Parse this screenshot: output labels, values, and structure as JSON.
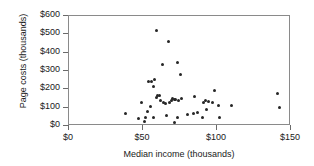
{
  "chart_data": {
    "type": "scatter",
    "title": "",
    "xlabel": "Median income (thousands)",
    "ylabel": "Page costs (thousands)",
    "xlim": [
      0,
      150
    ],
    "ylim": [
      0,
      600
    ],
    "xticks": [
      "$0",
      "$50",
      "$100",
      "$150"
    ],
    "xtick_values": [
      0,
      50,
      100,
      150
    ],
    "yticks": [
      "$0",
      "$100",
      "$200",
      "$300",
      "$400",
      "$500",
      "$600"
    ],
    "ytick_values": [
      0,
      100,
      200,
      300,
      400,
      500,
      600
    ],
    "grid": false,
    "legend": false,
    "marker_color": "#262626",
    "axis_color": "#8a8a8a",
    "points": [
      {
        "x": 38,
        "y": 70
      },
      {
        "x": 47,
        "y": 43
      },
      {
        "x": 49,
        "y": 128
      },
      {
        "x": 51,
        "y": 25
      },
      {
        "x": 52,
        "y": 45
      },
      {
        "x": 53,
        "y": 77
      },
      {
        "x": 54,
        "y": 243
      },
      {
        "x": 55,
        "y": 106
      },
      {
        "x": 56,
        "y": 245
      },
      {
        "x": 57,
        "y": 215
      },
      {
        "x": 57,
        "y": 47
      },
      {
        "x": 58,
        "y": 252
      },
      {
        "x": 59,
        "y": 155
      },
      {
        "x": 59,
        "y": 523
      },
      {
        "x": 60,
        "y": 165
      },
      {
        "x": 61,
        "y": 168
      },
      {
        "x": 62,
        "y": 137
      },
      {
        "x": 63,
        "y": 336
      },
      {
        "x": 64,
        "y": 128
      },
      {
        "x": 65,
        "y": 125
      },
      {
        "x": 66,
        "y": 60
      },
      {
        "x": 67,
        "y": 462
      },
      {
        "x": 68,
        "y": 130
      },
      {
        "x": 69,
        "y": 140
      },
      {
        "x": 70,
        "y": 148
      },
      {
        "x": 71,
        "y": 143
      },
      {
        "x": 71,
        "y": 18
      },
      {
        "x": 72,
        "y": 145
      },
      {
        "x": 73,
        "y": 345
      },
      {
        "x": 73,
        "y": 47
      },
      {
        "x": 74,
        "y": 140
      },
      {
        "x": 75,
        "y": 280
      },
      {
        "x": 76,
        "y": 148
      },
      {
        "x": 80,
        "y": 62
      },
      {
        "x": 84,
        "y": 68
      },
      {
        "x": 85,
        "y": 160
      },
      {
        "x": 87,
        "y": 72
      },
      {
        "x": 90,
        "y": 45
      },
      {
        "x": 91,
        "y": 128
      },
      {
        "x": 92,
        "y": 140
      },
      {
        "x": 93,
        "y": 92
      },
      {
        "x": 94,
        "y": 135
      },
      {
        "x": 97,
        "y": 130
      },
      {
        "x": 98,
        "y": 193
      },
      {
        "x": 101,
        "y": 112
      },
      {
        "x": 102,
        "y": 47
      },
      {
        "x": 110,
        "y": 110
      },
      {
        "x": 141,
        "y": 178
      },
      {
        "x": 142,
        "y": 100
      }
    ]
  }
}
